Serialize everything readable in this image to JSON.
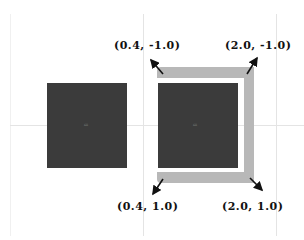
{
  "diagram": {
    "left_square": {
      "label": "fill"
    },
    "right_square": {
      "label": "fill"
    },
    "corners": {
      "top_left": "(0.4, -1.0)",
      "top_right": "(2.0, -1.0)",
      "bottom_left": "(0.4, 1.0)",
      "bottom_right": "(2.0, 1.0)"
    },
    "colors": {
      "square": "#3b3b3b",
      "frame": "#b8b8b8",
      "gridline": "#e4e4e4",
      "arrow": "#111111"
    }
  }
}
